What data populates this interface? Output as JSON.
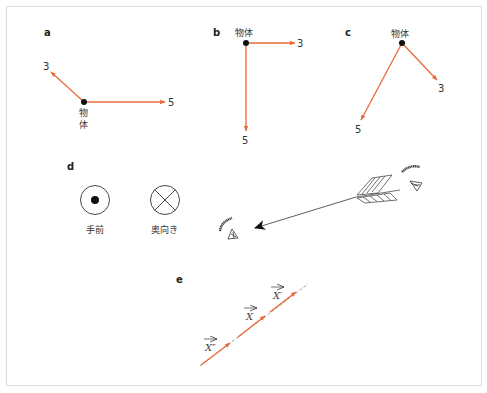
{
  "colors": {
    "vector": "#e8693a",
    "ink": "#222222",
    "frame": "#d8dde0",
    "dashed": "#888888"
  },
  "panels": {
    "a": {
      "label": "a",
      "object_label_line1": "物",
      "object_label_line2": "体",
      "vector1_value": "3",
      "vector2_value": "5"
    },
    "b": {
      "label": "b",
      "object_label": "物体",
      "vector1_value": "3",
      "vector2_value": "5"
    },
    "c": {
      "label": "c",
      "object_label": "物体",
      "vector1_value": "3",
      "vector2_value": "5"
    },
    "d": {
      "label": "d",
      "toward_viewer_label": "手前",
      "away_from_viewer_label": "奥向き"
    },
    "e": {
      "label": "e",
      "vectors": [
        {
          "name": "X",
          "prime": "″"
        },
        {
          "name": "X",
          "prime": ""
        },
        {
          "name": "X",
          "prime": "′"
        }
      ],
      "vec_label_lower": "X″",
      "vec_label_middle": "X",
      "vec_label_upper": "X′"
    }
  }
}
